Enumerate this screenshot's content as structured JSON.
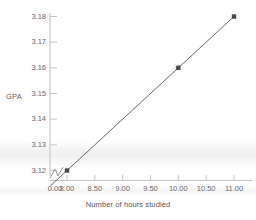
{
  "figure": {
    "background_color": "#ffffff",
    "faint_header_text": "",
    "artifact": "horizontal-scan-shadow-band"
  },
  "axes": {
    "y_label": "GPA",
    "x_label": "Number of hours studied",
    "axis_color": "#c9c9c9",
    "tick_label_color": "#6a6a6a",
    "has_axis_break": true,
    "axis_break_marker": "zigzag"
  },
  "chart_data": {
    "type": "line",
    "title": "",
    "xlabel": "Number of hours studied",
    "ylabel": "GPA",
    "x": [
      8.0,
      10.0,
      11.0
    ],
    "values": [
      3.12,
      3.16,
      3.18
    ],
    "series": [
      {
        "name": "GPA vs hours studied",
        "x": [
          8.0,
          10.0,
          11.0
        ],
        "values": [
          3.12,
          3.16,
          3.18
        ],
        "line_color": "#5a5a5a",
        "marker": "square",
        "marker_color": "#4a4a4a"
      }
    ],
    "xlim": [
      8.0,
      11.0
    ],
    "ylim": [
      3.115,
      3.182
    ],
    "xticks": [
      "0.00",
      "8.00",
      "8.50",
      "9.00",
      "9.50",
      "10.00",
      "10.50",
      "11.00"
    ],
    "xtick_values": [
      0.0,
      8.0,
      8.5,
      9.0,
      9.5,
      10.0,
      10.5,
      11.0
    ],
    "yticks": [
      "3.12",
      "3.13",
      "3.14",
      "3.15",
      "3.16",
      "3.17",
      "3.18"
    ],
    "ytick_values": [
      3.12,
      3.13,
      3.14,
      3.15,
      3.16,
      3.17,
      3.18
    ],
    "grid": false,
    "legend": null,
    "annotations": []
  }
}
